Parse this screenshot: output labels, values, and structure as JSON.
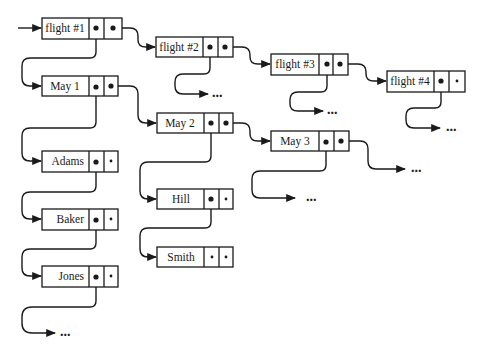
{
  "diagram": {
    "type": "multilinked-list",
    "colors": {
      "ink": "#1a1a1a",
      "background": "#ffffff"
    },
    "flights": [
      {
        "label": "flight #1",
        "down_ptr": "pointer",
        "next_ptr": "pointer"
      },
      {
        "label": "flight #2",
        "down_ptr": "pointer",
        "next_ptr": "pointer"
      },
      {
        "label": "flight #3",
        "down_ptr": "pointer",
        "next_ptr": "pointer"
      },
      {
        "label": "flight #4",
        "down_ptr": "pointer",
        "next_ptr": "null"
      }
    ],
    "dates": [
      {
        "label": "May 1",
        "down_ptr": "pointer",
        "next_ptr": "pointer"
      },
      {
        "label": "May 2",
        "down_ptr": "pointer",
        "next_ptr": "pointer"
      },
      {
        "label": "May 3",
        "down_ptr": "pointer",
        "next_ptr": "pointer"
      }
    ],
    "may1_passengers": [
      {
        "label": "Adams",
        "down_ptr": "pointer",
        "next_ptr": "null"
      },
      {
        "label": "Baker",
        "down_ptr": "pointer",
        "next_ptr": "null"
      },
      {
        "label": "Jones",
        "down_ptr": "pointer",
        "next_ptr": "null"
      }
    ],
    "may2_passengers": [
      {
        "label": "Hill",
        "down_ptr": "pointer",
        "next_ptr": "null"
      },
      {
        "label": "Smith",
        "down_ptr": "null",
        "next_ptr": "null"
      }
    ],
    "continuation": "..."
  }
}
